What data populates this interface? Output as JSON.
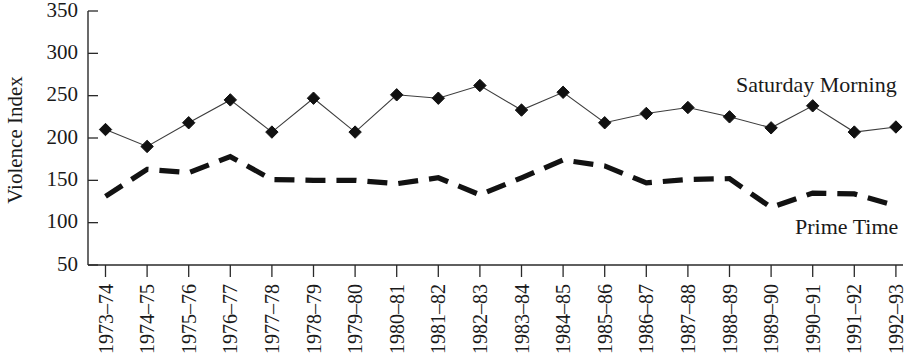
{
  "chart_data": {
    "type": "line",
    "title": "",
    "xlabel": "",
    "ylabel": "Violence Index",
    "ylim": [
      50,
      350
    ],
    "yticks": [
      50,
      100,
      150,
      200,
      250,
      300,
      350
    ],
    "grid": false,
    "legend_position": "inline-right",
    "categories": [
      "1973–74",
      "1974–75",
      "1975–76",
      "1976–77",
      "1977–78",
      "1978–79",
      "1979–80",
      "1980–81",
      "1981–82",
      "1982–83",
      "1983–84",
      "1984–85",
      "1985–86",
      "1986–87",
      "1987–88",
      "1988–89",
      "1989–90",
      "1990–91",
      "1991–92",
      "1992–93"
    ],
    "series": [
      {
        "name": "Saturday Morning",
        "marker": "diamond",
        "line_style": "solid",
        "color": "#111111",
        "values": [
          210,
          190,
          218,
          245,
          207,
          247,
          207,
          251,
          247,
          262,
          233,
          254,
          218,
          229,
          236,
          225,
          212,
          238,
          207,
          213
        ]
      },
      {
        "name": "Prime Time",
        "marker": "none",
        "line_style": "dashed",
        "color": "#111111",
        "values": [
          131,
          163,
          159,
          178,
          151,
          150,
          150,
          146,
          153,
          133,
          153,
          174,
          167,
          147,
          151,
          152,
          118,
          135,
          134,
          120
        ]
      }
    ],
    "annotations": [
      {
        "text": "Saturday Morning",
        "x_category": "1988–89",
        "value": 262
      },
      {
        "text": "Prime Time",
        "x_category": "1990–91",
        "value": 103
      }
    ]
  },
  "labels": {
    "y_axis_title": "Violence Index",
    "series_saturday": "Saturday Morning",
    "series_prime": "Prime Time"
  }
}
